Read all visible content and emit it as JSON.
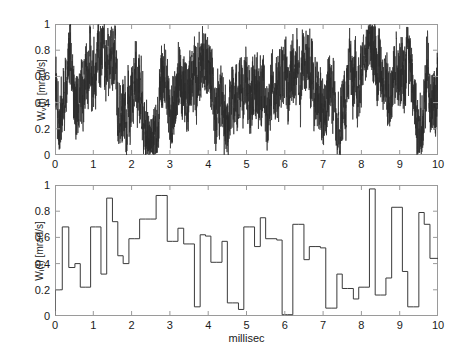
{
  "figure": {
    "background_color": "#ffffff",
    "trace_color": "#2b2b2b",
    "axis_color": "#9a9a9a"
  },
  "xlabel": "millisec",
  "panels": {
    "top": {
      "ylabel_main": "W",
      "ylabel_sub": "v",
      "ylabel_rest": "(t) [mrad/s]",
      "ylabel_full": "W_v(t) [mrad/s]",
      "yticks": [
        "0",
        "0.2",
        "0.4",
        "0.6",
        "0.8",
        "1"
      ],
      "ytick_values": [
        0,
        0.2,
        0.4,
        0.6,
        0.8,
        1
      ],
      "xticks": [
        "0",
        "1",
        "2",
        "3",
        "4",
        "5",
        "6",
        "7",
        "8",
        "9",
        "10"
      ],
      "xtick_values": [
        0,
        1,
        2,
        3,
        4,
        5,
        6,
        7,
        8,
        9,
        10
      ]
    },
    "bottom": {
      "ylabel_main": "W",
      "ylabel_sub": "i",
      "ylabel_rest": "(t) [mrad/s]",
      "ylabel_full": "W_i(t) [mrad/s]",
      "yticks": [
        "0",
        "0.2",
        "0.4",
        "0.6",
        "0.8",
        "1"
      ],
      "ytick_values": [
        0,
        0.2,
        0.4,
        0.6,
        0.8,
        1
      ],
      "xticks": [
        "0",
        "1",
        "2",
        "3",
        "4",
        "5",
        "6",
        "7",
        "8",
        "9",
        "10"
      ],
      "xtick_values": [
        0,
        1,
        2,
        3,
        4,
        5,
        6,
        7,
        8,
        9,
        10
      ]
    }
  },
  "chart_data": [
    {
      "type": "line",
      "name": "top-noise-signal",
      "title": "",
      "xlabel": "",
      "ylabel": "W_v(t) [mrad/s]",
      "xlim": [
        0,
        10
      ],
      "ylim": [
        0,
        1
      ],
      "grid": false,
      "legend": false,
      "description": "Dense high-frequency random noise signal, amplitude spanning roughly 0 to 1, mean near 0.55",
      "seed": 1337,
      "n_points": 3000,
      "envelope_mean": 0.55,
      "envelope_amplitude": 0.45
    },
    {
      "type": "line",
      "name": "bottom-step-signal",
      "title": "",
      "xlabel": "millisec",
      "ylabel": "W_i(t) [mrad/s]",
      "xlim": [
        0,
        10
      ],
      "ylim": [
        0,
        1
      ],
      "grid": false,
      "legend": false,
      "style": "step",
      "x": [
        0.0,
        0.19,
        0.36,
        0.52,
        0.66,
        0.79,
        0.93,
        1.06,
        1.2,
        1.35,
        1.5,
        1.64,
        1.78,
        1.93,
        2.07,
        2.21,
        2.36,
        2.5,
        2.64,
        2.79,
        2.93,
        3.07,
        3.21,
        3.36,
        3.5,
        3.64,
        3.79,
        3.93,
        4.07,
        4.21,
        4.36,
        4.5,
        4.64,
        4.79,
        4.93,
        5.07,
        5.21,
        5.36,
        5.5,
        5.64,
        5.79,
        5.93,
        6.07,
        6.21,
        6.36,
        6.5,
        6.64,
        6.79,
        6.93,
        7.07,
        7.21,
        7.36,
        7.5,
        7.64,
        7.79,
        7.93,
        8.07,
        8.21,
        8.36,
        8.5,
        8.64,
        8.79,
        8.93,
        9.07,
        9.21,
        9.36,
        9.5,
        9.64,
        9.79,
        10.0
      ],
      "values": [
        0.2,
        0.68,
        0.37,
        0.4,
        0.22,
        0.22,
        0.68,
        0.68,
        0.32,
        0.9,
        0.72,
        0.46,
        0.4,
        0.59,
        0.59,
        0.74,
        0.74,
        0.74,
        0.92,
        0.92,
        0.57,
        0.57,
        0.67,
        0.55,
        0.55,
        0.07,
        0.62,
        0.61,
        0.41,
        0.41,
        0.57,
        0.1,
        0.1,
        0.05,
        0.68,
        0.68,
        0.53,
        0.75,
        0.59,
        0.59,
        0.58,
        0.01,
        0.01,
        0.7,
        0.7,
        0.43,
        0.53,
        0.53,
        0.52,
        0.06,
        0.06,
        0.32,
        0.21,
        0.21,
        0.13,
        0.22,
        0.22,
        0.97,
        0.16,
        0.16,
        0.29,
        0.83,
        0.83,
        0.34,
        0.07,
        0.07,
        0.79,
        0.7,
        0.44,
        0.44
      ]
    }
  ]
}
